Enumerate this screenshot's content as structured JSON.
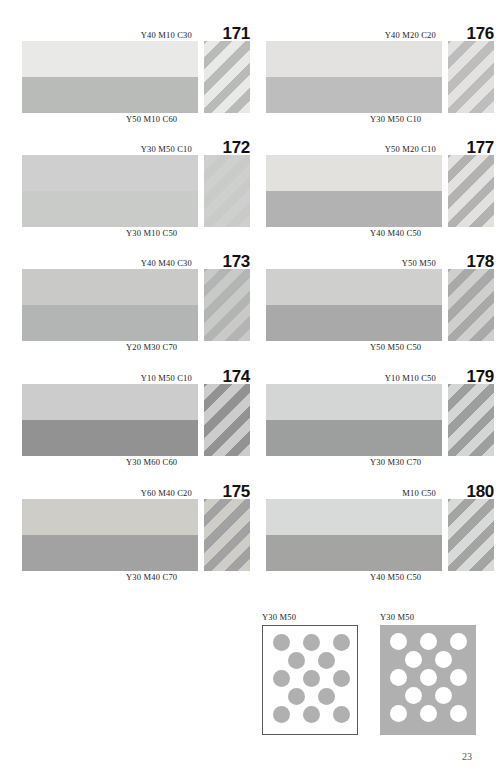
{
  "document": {
    "page_number": "23",
    "type": "color-reference-chart"
  },
  "swatches": [
    {
      "number": "171",
      "top_label": "Y40  M10  C30",
      "bottom_label": "Y50  M10  C60",
      "top_color": "#e9e9e7",
      "bottom_color": "#b9bbb9"
    },
    {
      "number": "176",
      "top_label": "Y40  M20  C20",
      "bottom_label": "Y30  M50  C10",
      "top_color": "#e3e2e0",
      "bottom_color": "#bdbdbd"
    },
    {
      "number": "172",
      "top_label": "Y30  M50  C10",
      "bottom_label": "Y30  M10  C50",
      "top_color": "#cfcfcf",
      "bottom_color": "#c9cbc9"
    },
    {
      "number": "177",
      "top_label": "Y50  M20  C10",
      "bottom_label": "Y40  M40  C50",
      "top_color": "#e2e1dd",
      "bottom_color": "#b2b2b2"
    },
    {
      "number": "173",
      "top_label": "Y40  M40  C30",
      "bottom_label": "Y20  M30  C70",
      "top_color": "#c9c9c7",
      "bottom_color": "#b3b5b4"
    },
    {
      "number": "178",
      "top_label": "Y50  M50",
      "bottom_label": "Y50  M50  C50",
      "top_color": "#cfcfcd",
      "bottom_color": "#a9a9a9"
    },
    {
      "number": "174",
      "top_label": "Y10  M50  C10",
      "bottom_label": "Y30  M60  C60",
      "top_color": "#cccccc",
      "bottom_color": "#929292"
    },
    {
      "number": "179",
      "top_label": "Y10  M10  C50",
      "bottom_label": "Y30  M30  C70",
      "top_color": "#d4d6d6",
      "bottom_color": "#9d9f9e"
    },
    {
      "number": "175",
      "top_label": "Y60  M40  C20",
      "bottom_label": "Y30  M40  C70",
      "top_color": "#cecdc7",
      "bottom_color": "#a2a2a2"
    },
    {
      "number": "180",
      "top_label": "M10  C50",
      "bottom_label": "Y40  M50  C50",
      "top_color": "#d8dad9",
      "bottom_color": "#a4a4a2"
    }
  ],
  "dot_panels": [
    {
      "label": "Y30  M50",
      "style": "dark-dots-on-white",
      "background": "#ffffff",
      "dot_color": "#b0b0b0"
    },
    {
      "label": "Y30  M50",
      "style": "white-dots-on-gray",
      "background": "#b0b0b0",
      "dot_color": "#ffffff"
    }
  ]
}
